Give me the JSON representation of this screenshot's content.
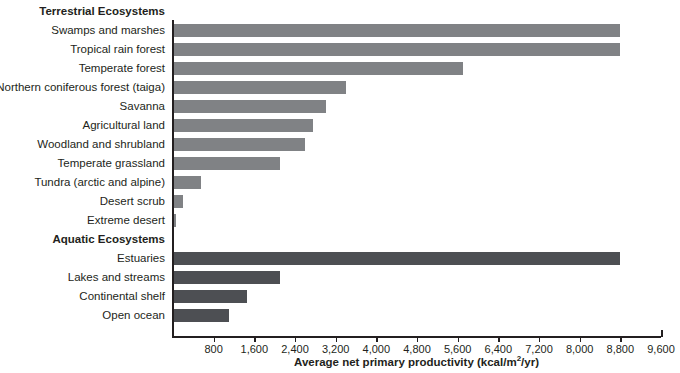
{
  "chart_data": {
    "type": "bar",
    "orientation": "horizontal",
    "title": "",
    "xlabel": "Average net primary productivity (kcal/m2/yr)",
    "xlabel_parts": {
      "pre": "Average net primary productivity (kcal/m",
      "sup": "2",
      "post": "/yr)"
    },
    "ylabel": "",
    "xlim": [
      0,
      9600
    ],
    "xticks": [
      800,
      1600,
      2400,
      3200,
      4000,
      4800,
      5600,
      6400,
      7200,
      8000,
      8800,
      9600
    ],
    "xticklabels": [
      "800",
      "1,600",
      "2,400",
      "3,200",
      "4,000",
      "4,800",
      "5,600",
      "6,400",
      "7,200",
      "8,000",
      "8,800",
      "9,600"
    ],
    "grid": false,
    "legend": null,
    "colors": {
      "terrestrial": "#808285",
      "aquatic": "#4d4f53",
      "axis": "#231f20"
    },
    "groups": [
      {
        "name": "Terrestrial Ecosystems",
        "color_key": "terrestrial",
        "categories": [
          "Swamps and marshes",
          "Tropical rain forest",
          "Temperate forest",
          "Northern coniferous forest (taiga)",
          "Savanna",
          "Agricultural land",
          "Woodland and shrubland",
          "Temperate grassland",
          "Tundra (arctic and alpine)",
          "Desert scrub",
          "Extreme desert"
        ],
        "values": [
          8800,
          8800,
          5700,
          3400,
          3000,
          2750,
          2600,
          2100,
          550,
          200,
          60
        ]
      },
      {
        "name": "Aquatic Ecosystems",
        "color_key": "aquatic",
        "categories": [
          "Estuaries",
          "Lakes and streams",
          "Continental shelf",
          "Open ocean"
        ],
        "values": [
          8800,
          2100,
          1450,
          1100
        ]
      }
    ]
  },
  "rows": [
    {
      "kind": "group",
      "label": "Terrestrial Ecosystems"
    },
    {
      "kind": "bar",
      "label": "Swamps and marshes",
      "value": 8800,
      "group": "terrestrial"
    },
    {
      "kind": "bar",
      "label": "Tropical rain forest",
      "value": 8800,
      "group": "terrestrial"
    },
    {
      "kind": "bar",
      "label": "Temperate forest",
      "value": 5700,
      "group": "terrestrial"
    },
    {
      "kind": "bar",
      "label": "Northern coniferous forest (taiga)",
      "value": 3400,
      "group": "terrestrial"
    },
    {
      "kind": "bar",
      "label": "Savanna",
      "value": 3000,
      "group": "terrestrial"
    },
    {
      "kind": "bar",
      "label": "Agricultural land",
      "value": 2750,
      "group": "terrestrial"
    },
    {
      "kind": "bar",
      "label": "Woodland and shrubland",
      "value": 2600,
      "group": "terrestrial"
    },
    {
      "kind": "bar",
      "label": "Temperate grassland",
      "value": 2100,
      "group": "terrestrial"
    },
    {
      "kind": "bar",
      "label": "Tundra (arctic and alpine)",
      "value": 550,
      "group": "terrestrial"
    },
    {
      "kind": "bar",
      "label": "Desert scrub",
      "value": 200,
      "group": "terrestrial"
    },
    {
      "kind": "bar",
      "label": "Extreme desert",
      "value": 60,
      "group": "terrestrial"
    },
    {
      "kind": "group",
      "label": "Aquatic Ecosystems"
    },
    {
      "kind": "bar",
      "label": "Estuaries",
      "value": 8800,
      "group": "aquatic"
    },
    {
      "kind": "bar",
      "label": "Lakes and streams",
      "value": 2100,
      "group": "aquatic"
    },
    {
      "kind": "bar",
      "label": "Continental shelf",
      "value": 1450,
      "group": "aquatic"
    },
    {
      "kind": "bar",
      "label": "Open ocean",
      "value": 1100,
      "group": "aquatic"
    }
  ],
  "axis": {
    "title_pre": "Average net primary productivity (kcal/m",
    "title_sup": "2",
    "title_post": "/yr)"
  }
}
